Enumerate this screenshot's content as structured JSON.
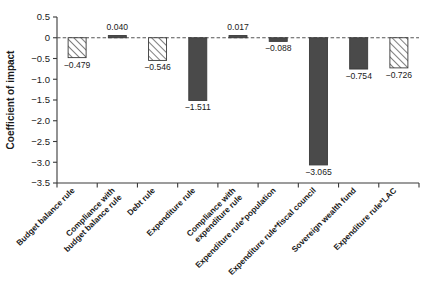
{
  "chart_data": {
    "type": "bar",
    "title": "",
    "xlabel": "",
    "ylabel": "Coefficient of impact",
    "ylim": [
      -3.5,
      0.5
    ],
    "yticks": [
      0.5,
      0,
      -0.5,
      -1.0,
      -1.5,
      -2.0,
      -2.5,
      -3.0,
      -3.5
    ],
    "ytick_labels": [
      "0.5",
      "0",
      "−0.5",
      "−1.0",
      "−1.5",
      "−2.0",
      "−2.5",
      "−3.0",
      "−3.5"
    ],
    "grid": false,
    "legend": "none",
    "zero_reference_line": true,
    "categories": [
      "Budget balance rule",
      "Compliance with budget balance rule",
      "Debt rule",
      "Expenditure rule",
      "Compliance with expenditure rule",
      "Expenditure rule*population",
      "Expenditure rule*fiscal council",
      "Sovereign wealth fund",
      "Expenditure rule*LAC"
    ],
    "values": [
      -0.479,
      0.04,
      -0.546,
      -1.511,
      0.017,
      -0.088,
      -3.065,
      -0.754,
      -0.726
    ],
    "value_labels": [
      "−0.479",
      "0.040",
      "−0.546",
      "−1.511",
      "0.017",
      "−0.088",
      "−3.065",
      "−0.754",
      "−0.726"
    ],
    "bar_styles": [
      "hatched",
      "solid",
      "hatched",
      "solid",
      "solid",
      "solid",
      "solid",
      "solid",
      "hatched"
    ],
    "colors": {
      "solid_fill": "#4a4a4a",
      "hatch_line": "#555555",
      "hatch_background": "#ffffff",
      "bar_edge": "#3a3a3a",
      "axis": "#3a3a3a",
      "text": "#1a1a1a"
    }
  }
}
